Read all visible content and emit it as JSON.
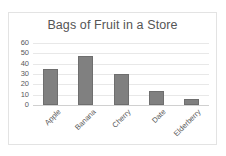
{
  "chart_data": {
    "type": "bar",
    "title": "Bags of Fruit in a Store",
    "categories": [
      "Apple",
      "Banana",
      "Cherry",
      "Date",
      "Elderberry"
    ],
    "values": [
      35,
      47,
      30,
      14,
      6
    ],
    "xlabel": "",
    "ylabel": "",
    "ylim": [
      0,
      60
    ],
    "y_ticks": [
      60,
      50,
      40,
      30,
      20,
      10,
      0
    ],
    "grid": true,
    "legend": false,
    "bar_color": "#808080",
    "bar_border_color": "#6e6e6e",
    "gridline_color": "#e8e8e8",
    "axis_color": "#d0d0d0",
    "text_color": "#595959",
    "title_color": "#555555",
    "plot_background": "#ffffff",
    "frame_border_color": "#e3e3e3"
  }
}
